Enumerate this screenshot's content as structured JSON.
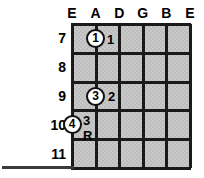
{
  "diagram": {
    "type": "guitar-fretboard-chord-diagram",
    "title": "",
    "strings": [
      {
        "name": "E",
        "index": 0
      },
      {
        "name": "A",
        "index": 1
      },
      {
        "name": "D",
        "index": 2
      },
      {
        "name": "G",
        "index": 3
      },
      {
        "name": "B",
        "index": 4
      },
      {
        "name": "E",
        "index": 5
      }
    ],
    "frets": [
      {
        "number": "7"
      },
      {
        "number": "8"
      },
      {
        "number": "9"
      },
      {
        "number": "10"
      },
      {
        "number": "11"
      }
    ],
    "markers": [
      {
        "finger": "1",
        "string": "A",
        "string_index": 1,
        "fret": "7",
        "fret_index": 0,
        "label": "1",
        "label_position": "right"
      },
      {
        "finger": "3",
        "string": "A",
        "string_index": 1,
        "fret": "9",
        "fret_index": 2,
        "label": "2",
        "label_position": "right"
      },
      {
        "finger": "4",
        "string": "E",
        "string_index": 0,
        "fret": "10",
        "fret_index": 3,
        "label": "3",
        "label_above": "3",
        "label_below": "R",
        "label_position": "right-stacked"
      }
    ],
    "colors": {
      "grid_line": "#1a1a1a",
      "board_fill": "#c9c9c9",
      "marker_fill": "#ffffff",
      "marker_border": "#111111",
      "text": "#000000",
      "background": "#ffffff"
    }
  }
}
